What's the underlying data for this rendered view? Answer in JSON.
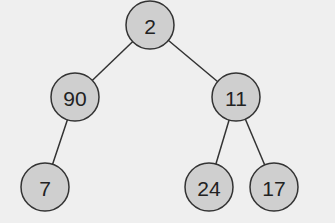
{
  "diagram": {
    "type": "binary-tree",
    "nodes": [
      {
        "id": "n0",
        "label": "2",
        "x": 150,
        "y": 25
      },
      {
        "id": "n1",
        "label": "90",
        "x": 75,
        "y": 97
      },
      {
        "id": "n2",
        "label": "11",
        "x": 236,
        "y": 97
      },
      {
        "id": "n3",
        "label": "7",
        "x": 45,
        "y": 187
      },
      {
        "id": "n4",
        "label": "24",
        "x": 209,
        "y": 187
      },
      {
        "id": "n5",
        "label": "17",
        "x": 274,
        "y": 187
      }
    ],
    "edges": [
      {
        "from": "n0",
        "to": "n1"
      },
      {
        "from": "n0",
        "to": "n2"
      },
      {
        "from": "n1",
        "to": "n3"
      },
      {
        "from": "n2",
        "to": "n4"
      },
      {
        "from": "n2",
        "to": "n5"
      }
    ],
    "colors": {
      "node_fill": "#cfcfcf",
      "stroke": "#333333",
      "background": "#efefef"
    }
  }
}
